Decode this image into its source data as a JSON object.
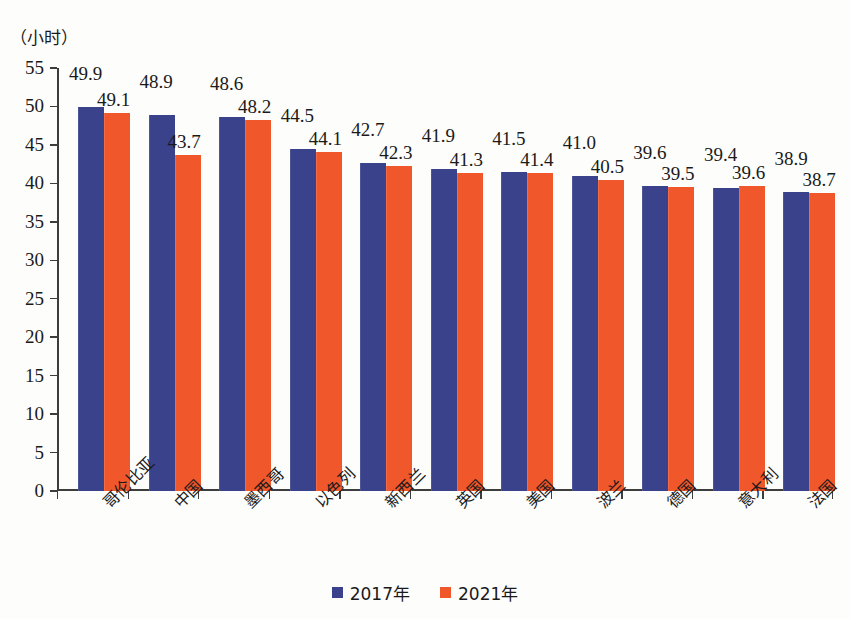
{
  "chart_data": {
    "type": "bar",
    "title": "",
    "subtitle": "",
    "xlabel": "",
    "ylabel": "（小时）",
    "ylim": [
      0,
      55
    ],
    "ytick_step": 5,
    "yticks": [
      "55",
      "50",
      "45",
      "40",
      "35",
      "30",
      "25",
      "20",
      "15",
      "10",
      "5",
      "0"
    ],
    "grid": false,
    "legend_position": "bottom-center",
    "categories": [
      "哥伦比亚",
      "中国",
      "墨西哥",
      "以色列",
      "新西兰",
      "英国",
      "美国",
      "波兰",
      "德国",
      "意大利",
      "法国"
    ],
    "series": [
      {
        "name": "2017年",
        "color": "#39428a",
        "values": [
          49.9,
          48.9,
          48.6,
          44.5,
          42.7,
          41.9,
          41.5,
          41.0,
          39.6,
          39.4,
          38.9
        ],
        "labels": [
          "49.9",
          "48.9",
          "48.6",
          "44.5",
          "42.7",
          "41.9",
          "41.5",
          "41.0",
          "39.6",
          "39.4",
          "38.9"
        ]
      },
      {
        "name": "2021年",
        "color": "#f0572a",
        "values": [
          49.1,
          43.7,
          48.2,
          44.1,
          42.3,
          41.3,
          41.4,
          40.5,
          39.5,
          39.6,
          38.7
        ],
        "labels": [
          "49.1",
          "43.7",
          "48.2",
          "44.1",
          "42.3",
          "41.3",
          "41.4",
          "40.5",
          "39.5",
          "39.6",
          "38.7"
        ]
      }
    ]
  },
  "axis": {
    "unit_label": "（小时）"
  },
  "legend": {
    "items": [
      {
        "label": "2017年",
        "color": "#39428a"
      },
      {
        "label": "2021年",
        "color": "#f0572a"
      }
    ]
  }
}
